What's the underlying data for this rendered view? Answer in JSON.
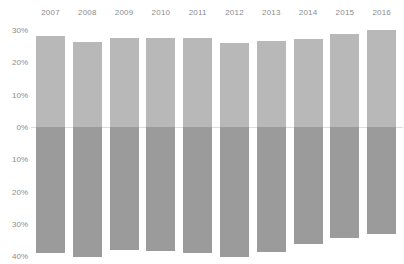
{
  "chart_data": {
    "type": "bar",
    "title": "",
    "subtitle": "",
    "xlabel": "",
    "ylabel": "",
    "orientation": "vertical",
    "diverging": true,
    "grid": false,
    "legend": "none",
    "categories": [
      "2007",
      "2008",
      "2009",
      "2010",
      "2011",
      "2012",
      "2013",
      "2014",
      "2015",
      "2016"
    ],
    "x_tick_labels": [
      "2007",
      "2008",
      "2009",
      "2010",
      "2011",
      "2012",
      "2013",
      "2014",
      "2015",
      "2016"
    ],
    "x_labels_position": "top",
    "y_tick_labels": [
      "30%",
      "20%",
      "10%",
      "0%",
      "10%",
      "20%",
      "30%",
      "40%"
    ],
    "y_tick_values": [
      30,
      20,
      10,
      0,
      -10,
      -20,
      -30,
      -40
    ],
    "ylim": [
      -42,
      30
    ],
    "series": [
      {
        "name": "Positive",
        "color": "#b8b8b8",
        "values": [
          28.2,
          26.3,
          27.4,
          27.4,
          27.4,
          25.9,
          26.6,
          27.2,
          28.9,
          30.0
        ]
      },
      {
        "name": "Negative",
        "color": "#9b9b9b",
        "values": [
          -38.9,
          -40.2,
          -38.0,
          -38.3,
          -38.9,
          -40.2,
          -38.6,
          -36.2,
          -34.4,
          -33.1
        ]
      }
    ],
    "colors": {
      "positive_bar": "#b8b8b8",
      "negative_bar": "#9b9b9b",
      "zero_line": "#dcdcdc",
      "tick_text": "#8c8c8c",
      "background": "#ffffff"
    }
  }
}
